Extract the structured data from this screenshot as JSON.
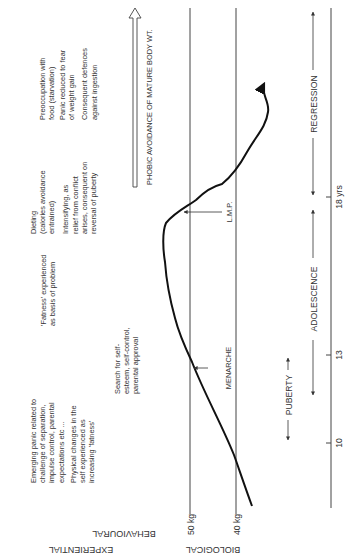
{
  "figure": {
    "orientation": "rotated 90deg counter-clockwise",
    "row_labels": {
      "experiential": "EXPERIENTIAL",
      "behavioural": "BEHAVIOURAL",
      "biological": "BIOLOGICAL"
    },
    "weight_labels": {
      "w50": "50 kg",
      "w40": "40 kg"
    },
    "age_ticks": {
      "t10": "10",
      "t13": "13",
      "t18": "18 yrs"
    },
    "phases": {
      "puberty": "PUBERTY",
      "adolescence": "ADOLESCENCE",
      "regression": "REGRESSION"
    },
    "markers": {
      "menarche": "MENARCHE",
      "lmp": "L.M.P."
    },
    "phobic_arrow": "PHOBIC AVOIDANCE OF MATURE BODY WT.",
    "experiential_col1": {
      "line1": "Emerging panic related to",
      "line2": "challenge of separation,",
      "line3": "impulse control, parental",
      "line4": "expectations etc ...",
      "line5": "Physical changes in the",
      "line6": "self experienced as",
      "line7": "increasing 'fatness'"
    },
    "experiential_col2": {
      "line1": "'Fatness' experienced",
      "line2": "as basis of problem"
    },
    "behavioural_col2": {
      "line1": "Search for self-",
      "line2": "esteem, self-control,",
      "line3": "parental approval"
    },
    "col3": {
      "line1": "Dieting",
      "line2": "(calories avoidance",
      "line3": "entrained)",
      "line4": "Intensifying, as",
      "line5": "relief from conflict",
      "line6": "arises, consequent on",
      "line7": "reversal of puberty"
    },
    "col4": {
      "line1": "Preoccupation with",
      "line2": "food (starvation)",
      "line3": "Panic reduced to fear",
      "line4": "of weight gain",
      "line5": "Consequent defences",
      "line6": "against ingestion"
    }
  }
}
